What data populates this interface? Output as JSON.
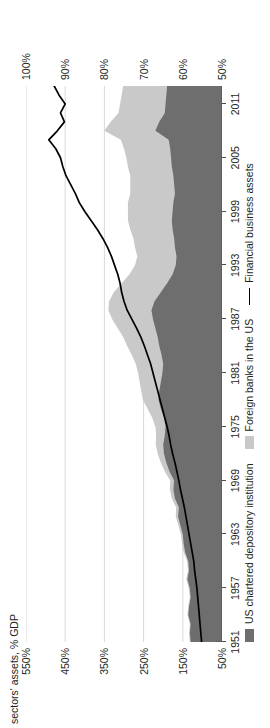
{
  "axis": {
    "left_title": "sectors' assets, % GDP",
    "left_ticks": [
      "50%",
      "150%",
      "250%",
      "350%",
      "450%",
      "550%"
    ],
    "left_values": [
      50,
      150,
      250,
      350,
      450,
      550
    ],
    "right_ticks": [
      "50%",
      "60%",
      "70%",
      "80%",
      "90%",
      "100%"
    ],
    "right_values": [
      50,
      60,
      70,
      80,
      90,
      100
    ],
    "x_ticks": [
      "1951",
      "1957",
      "1963",
      "1969",
      "1975",
      "1981",
      "1987",
      "1993",
      "1999",
      "2005",
      "2011"
    ]
  },
  "legend": {
    "items": [
      {
        "label": "US chartered depository institution",
        "type": "area",
        "color": "#6e6e6e"
      },
      {
        "label": "Foreign banks in the US",
        "type": "area",
        "color": "#c9c9c9"
      },
      {
        "label": "Financial business assets",
        "type": "line",
        "color": "#000000"
      }
    ]
  },
  "colors": {
    "dark_area": "#6e6e6e",
    "light_area": "#c9c9c9",
    "line": "#000000",
    "grid": "#d9d9d9",
    "axis": "#4d4d4d",
    "text": "#231f20",
    "background": "#ffffff"
  },
  "chart_data": {
    "type": "area",
    "title": "",
    "subtitle": "",
    "xlabel": "",
    "ylabel": "sectors' assets, % GDP",
    "ylabel_secondary": "sectors' assets, % GDP",
    "grid": true,
    "legend_position": "bottom-left",
    "note": "Stacked area on right-hand scale (50-100% GDP); black line 'Financial business assets' on left-hand scale (50-550% GDP).",
    "ylim_left": [
      50,
      550
    ],
    "ylim_right": [
      50,
      100
    ],
    "xlim": [
      1951,
      2013
    ],
    "x": [
      1951,
      1952,
      1953,
      1954,
      1955,
      1956,
      1957,
      1958,
      1959,
      1960,
      1961,
      1962,
      1963,
      1964,
      1965,
      1966,
      1967,
      1968,
      1969,
      1970,
      1971,
      1972,
      1973,
      1974,
      1975,
      1976,
      1977,
      1978,
      1979,
      1980,
      1981,
      1982,
      1983,
      1984,
      1985,
      1986,
      1987,
      1988,
      1989,
      1990,
      1991,
      1992,
      1993,
      1994,
      1995,
      1996,
      1997,
      1998,
      1999,
      2000,
      2001,
      2002,
      2003,
      2004,
      2005,
      2006,
      2007,
      2008,
      2009,
      2010,
      2011,
      2012,
      2013
    ],
    "series": [
      {
        "name": "US chartered depository institution",
        "axis": "right",
        "units": "% GDP",
        "stack": "bottom",
        "values": [
          58.0,
          58.2,
          58.0,
          58.6,
          58.4,
          58.0,
          58.2,
          58.8,
          58.4,
          58.6,
          59.4,
          59.8,
          60.0,
          60.6,
          61.2,
          61.0,
          62.0,
          62.4,
          62.2,
          63.4,
          64.2,
          64.8,
          65.0,
          64.6,
          64.4,
          64.8,
          65.6,
          66.2,
          66.0,
          65.6,
          65.2,
          65.0,
          65.4,
          66.0,
          66.4,
          67.0,
          67.6,
          68.0,
          67.2,
          65.6,
          64.0,
          62.6,
          61.8,
          61.6,
          62.0,
          62.2,
          62.6,
          62.8,
          62.6,
          62.4,
          62.0,
          62.2,
          62.4,
          62.8,
          63.0,
          63.2,
          63.6,
          67.0,
          66.0,
          64.6,
          64.4,
          64.2,
          64.0
        ]
      },
      {
        "name": "Foreign banks in the US",
        "axis": "right",
        "units": "% GDP",
        "stack": "top",
        "values": [
          0.2,
          0.2,
          0.2,
          0.2,
          0.2,
          0.2,
          0.3,
          0.3,
          0.3,
          0.3,
          0.4,
          0.4,
          0.5,
          0.5,
          0.6,
          0.7,
          0.8,
          0.9,
          1.0,
          1.2,
          1.4,
          1.6,
          1.9,
          2.2,
          2.6,
          3.0,
          3.4,
          4.0,
          4.6,
          5.4,
          6.2,
          7.0,
          7.6,
          8.2,
          8.8,
          9.6,
          10.4,
          11.0,
          11.6,
          12.0,
          11.6,
          11.0,
          10.4,
          10.0,
          10.2,
          10.4,
          10.8,
          11.2,
          11.4,
          11.6,
          11.4,
          11.2,
          11.0,
          11.2,
          11.4,
          11.8,
          12.2,
          13.0,
          12.4,
          11.8,
          11.6,
          11.4,
          11.2
        ]
      },
      {
        "name": "Financial business assets",
        "axis": "left",
        "units": "% GDP",
        "type": "line",
        "values": [
          102,
          104,
          106,
          108,
          110,
          112,
          114,
          117,
          120,
          122,
          126,
          130,
          134,
          138,
          142,
          146,
          151,
          156,
          160,
          165,
          170,
          176,
          181,
          185,
          190,
          196,
          202,
          208,
          214,
          220,
          226,
          232,
          240,
          248,
          257,
          268,
          280,
          292,
          300,
          306,
          310,
          316,
          324,
          332,
          342,
          354,
          368,
          384,
          400,
          414,
          424,
          436,
          448,
          456,
          462,
          474,
          492,
          470,
          452,
          462,
          450,
          466,
          478
        ]
      }
    ]
  }
}
